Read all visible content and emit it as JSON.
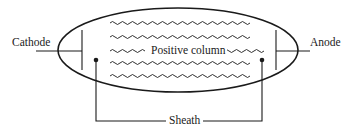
{
  "diagram": {
    "labels": {
      "cathode": "Cathode",
      "anode": "Anode",
      "positive_column": "Positive column",
      "sheath": "Sheath"
    },
    "colors": {
      "stroke": "#1a1a1a",
      "background": "#ffffff"
    },
    "elements": {
      "tube": {
        "shape": "ellipse",
        "cx": 178,
        "cy": 50,
        "rx": 120,
        "ry": 42
      },
      "cathode_plate": {
        "x": 82,
        "y1": 30,
        "y2": 70,
        "wire_to_x": 36,
        "wire_y": 51
      },
      "anode_plate": {
        "x": 276,
        "y1": 30,
        "y2": 70,
        "wire_to_x": 310,
        "wire_y": 51
      },
      "sheath_markers": [
        {
          "x": 96,
          "y": 60
        },
        {
          "x": 262,
          "y": 60
        }
      ],
      "sheath_bracket_y": 121,
      "wave_rows": 5
    }
  }
}
